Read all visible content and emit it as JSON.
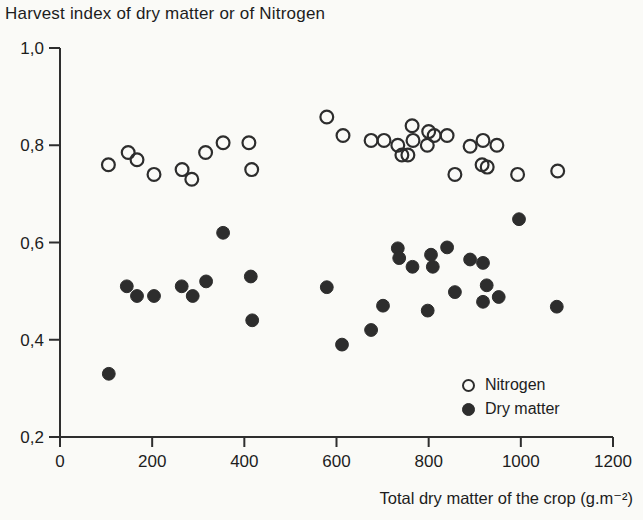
{
  "colors": {
    "background": "#fafaf7",
    "axis": "#2e2e2e",
    "text": "#1d1d1d",
    "marker": "#2d2d2d"
  },
  "chart_data": {
    "type": "scatter",
    "title": "Harvest index of dry matter or of Nitrogen",
    "xlabel": "Total dry matter of the crop (g.m⁻²)",
    "ylabel": "",
    "xlim": [
      0,
      1200
    ],
    "ylim": [
      0.2,
      1.0
    ],
    "x_ticks": [
      0,
      200,
      400,
      600,
      800,
      1000,
      1200
    ],
    "y_ticks": [
      0.2,
      0.4,
      0.6,
      0.8,
      1.0
    ],
    "y_tick_labels": [
      "0,2",
      "0,4",
      "0,6",
      "0,8",
      "1,0"
    ],
    "grid": false,
    "legend_position": "lower right",
    "legend": [
      {
        "label": "Nitrogen",
        "marker": "open-circle"
      },
      {
        "label": "Dry matter",
        "marker": "filled-circle"
      }
    ],
    "series": [
      {
        "name": "Nitrogen",
        "marker": "open-circle",
        "points": [
          [
            105,
            0.76
          ],
          [
            148,
            0.785
          ],
          [
            167,
            0.77
          ],
          [
            204,
            0.74
          ],
          [
            265,
            0.75
          ],
          [
            286,
            0.73
          ],
          [
            316,
            0.785
          ],
          [
            354,
            0.805
          ],
          [
            410,
            0.805
          ],
          [
            416,
            0.75
          ],
          [
            579,
            0.858
          ],
          [
            614,
            0.82
          ],
          [
            675,
            0.81
          ],
          [
            703,
            0.81
          ],
          [
            733,
            0.8
          ],
          [
            742,
            0.78
          ],
          [
            755,
            0.78
          ],
          [
            764,
            0.84
          ],
          [
            766,
            0.81
          ],
          [
            797,
            0.8
          ],
          [
            800,
            0.828
          ],
          [
            812,
            0.82
          ],
          [
            840,
            0.82
          ],
          [
            857,
            0.74
          ],
          [
            890,
            0.798
          ],
          [
            916,
            0.76
          ],
          [
            918,
            0.81
          ],
          [
            927,
            0.755
          ],
          [
            948,
            0.8
          ],
          [
            993,
            0.74
          ],
          [
            1080,
            0.747
          ]
        ]
      },
      {
        "name": "Dry matter",
        "marker": "filled-circle",
        "points": [
          [
            106,
            0.33
          ],
          [
            145,
            0.51
          ],
          [
            167,
            0.49
          ],
          [
            204,
            0.49
          ],
          [
            264,
            0.51
          ],
          [
            288,
            0.49
          ],
          [
            317,
            0.52
          ],
          [
            354,
            0.62
          ],
          [
            414,
            0.53
          ],
          [
            417,
            0.44
          ],
          [
            579,
            0.508
          ],
          [
            612,
            0.39
          ],
          [
            675,
            0.42
          ],
          [
            701,
            0.47
          ],
          [
            733,
            0.588
          ],
          [
            736,
            0.568
          ],
          [
            765,
            0.55
          ],
          [
            798,
            0.46
          ],
          [
            805,
            0.575
          ],
          [
            809,
            0.55
          ],
          [
            840,
            0.59
          ],
          [
            857,
            0.498
          ],
          [
            890,
            0.565
          ],
          [
            918,
            0.558
          ],
          [
            918,
            0.478
          ],
          [
            926,
            0.512
          ],
          [
            952,
            0.488
          ],
          [
            996,
            0.648
          ],
          [
            1078,
            0.468
          ]
        ]
      }
    ]
  }
}
